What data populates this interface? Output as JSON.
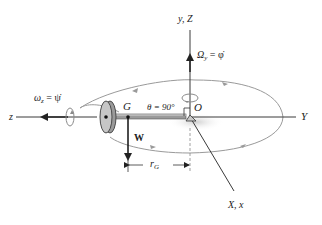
{
  "diagram": {
    "colors": {
      "axis": "#3a3a3a",
      "orbit": "#9a9a9a",
      "shadow": "#d4d4d4",
      "disk_fill": "#b9b9b9",
      "disk_edge": "#4a4a4a",
      "rod": "#8a8a8a",
      "text": "#222222"
    },
    "labels": {
      "vertical_axis": "y, Z",
      "omega_y": "Ω",
      "omega_y_sub": "y",
      "omega_y_rhs": "= φ̇",
      "omega_z": "ω",
      "omega_z_sub": "z",
      "omega_z_rhs": "= ψ̇",
      "z_axis": "z",
      "Y_axis": "Y",
      "X_axis": "X, x",
      "G": "G",
      "O": "O",
      "theta": "θ = 90°",
      "weight": "W",
      "r_G": "r",
      "r_G_sub": "G"
    },
    "nodes": [
      {
        "id": "O",
        "label": "O",
        "role": "fixed pivot / origin"
      },
      {
        "id": "G",
        "label": "G",
        "role": "center of mass of disk"
      },
      {
        "id": "disk",
        "label": "",
        "role": "spinning disk on rod"
      }
    ],
    "edges": [
      {
        "from": "O",
        "to": "G",
        "label": "r_G",
        "type": "dimension"
      },
      {
        "from": "G",
        "to": "down",
        "label": "W",
        "type": "force"
      },
      {
        "from": "O",
        "to": "up",
        "label": "Ω_y = φ̇",
        "type": "angular velocity"
      },
      {
        "from": "disk",
        "to": "z",
        "label": "ω_z = ψ̇",
        "type": "angular velocity"
      }
    ]
  }
}
